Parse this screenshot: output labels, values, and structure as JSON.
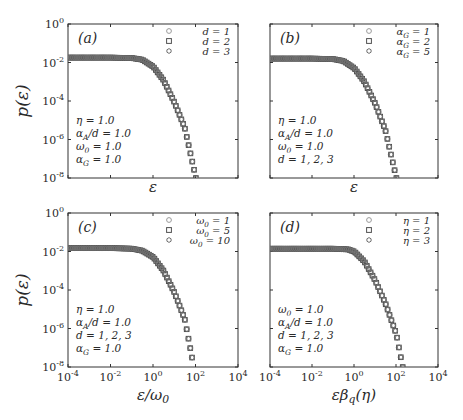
{
  "figure": {
    "width": 463,
    "height": 420,
    "y_label": "p(ε)",
    "y_ticks": [
      "10^0",
      "10^-2",
      "10^-4",
      "10^-6",
      "10^-8"
    ],
    "x_ticks": [
      "10^-4",
      "10^-2",
      "10^0",
      "10^2",
      "10^4"
    ],
    "colors": {
      "axis": "#333333",
      "marker_1": "#9a9a9a",
      "marker_2": "#505050",
      "marker_3": "#707070",
      "text": "#2a2a2a"
    }
  },
  "chart_data": [
    {
      "panel": "(a)",
      "type": "scatter",
      "title": "",
      "xlabel": "ε",
      "ylabel": "p(ε)",
      "xscale": "log",
      "yscale": "log",
      "xlim": [
        0.0001,
        10000
      ],
      "ylim": [
        1e-08,
        1
      ],
      "x_tick_labels_shown": false,
      "legend_position": "upper right",
      "legend": [
        {
          "marker": "circle",
          "label": "d = 1"
        },
        {
          "marker": "square",
          "label": "d = 2"
        },
        {
          "marker": "hexagon",
          "label": "d = 3"
        }
      ],
      "annotation": [
        "η = 1.0",
        "α_A/d = 1.0",
        "ω_0 = 1.0",
        "α_G = 1.0"
      ],
      "series": [
        {
          "name": "d = 1",
          "x": [
            0.0001,
            0.001,
            0.01,
            0.1,
            0.3,
            1,
            3,
            10,
            30,
            100
          ],
          "y": [
            0.018,
            0.018,
            0.018,
            0.017,
            0.014,
            0.006,
            0.0012,
            8e-05,
            4e-06,
            1e-08
          ]
        },
        {
          "name": "d = 2",
          "x": [
            0.0001,
            0.001,
            0.01,
            0.1,
            0.3,
            1,
            3,
            10,
            30,
            100
          ],
          "y": [
            0.018,
            0.018,
            0.018,
            0.017,
            0.014,
            0.006,
            0.0012,
            8e-05,
            4e-06,
            1e-08
          ]
        },
        {
          "name": "d = 3",
          "x": [
            0.0001,
            0.001,
            0.01,
            0.1,
            0.3,
            1,
            3,
            10,
            30,
            100
          ],
          "y": [
            0.018,
            0.018,
            0.018,
            0.017,
            0.014,
            0.006,
            0.0012,
            8e-05,
            4e-06,
            1e-08
          ]
        }
      ]
    },
    {
      "panel": "(b)",
      "type": "scatter",
      "title": "",
      "xlabel": "ε",
      "ylabel": "",
      "xscale": "log",
      "yscale": "log",
      "xlim": [
        0.0001,
        10000
      ],
      "ylim": [
        1e-08,
        1
      ],
      "x_tick_labels_shown": false,
      "legend_position": "upper right",
      "legend": [
        {
          "marker": "circle",
          "label": "α_G = 1"
        },
        {
          "marker": "square",
          "label": "α_G = 2"
        },
        {
          "marker": "hexagon",
          "label": "α_G = 5"
        }
      ],
      "annotation": [
        "η = 1.0",
        "α_A/d = 1.0",
        "ω_0 = 1.0",
        "d = 1, 2, 3"
      ],
      "series": [
        {
          "name": "α_G = 1",
          "x": [
            0.0001,
            0.001,
            0.01,
            0.1,
            0.3,
            1,
            3,
            10,
            30,
            100
          ],
          "y": [
            0.016,
            0.016,
            0.016,
            0.015,
            0.012,
            0.005,
            0.001,
            7e-05,
            3e-06,
            1e-08
          ]
        },
        {
          "name": "α_G = 2",
          "x": [
            0.0001,
            0.001,
            0.01,
            0.1,
            0.3,
            1,
            3,
            10,
            30,
            100
          ],
          "y": [
            0.016,
            0.016,
            0.016,
            0.015,
            0.012,
            0.005,
            0.001,
            7e-05,
            3e-06,
            1e-08
          ]
        },
        {
          "name": "α_G = 5",
          "x": [
            0.0001,
            0.001,
            0.01,
            0.1,
            0.3,
            1,
            3,
            10,
            30,
            100
          ],
          "y": [
            0.016,
            0.016,
            0.016,
            0.015,
            0.012,
            0.005,
            0.001,
            7e-05,
            3e-06,
            1e-08
          ]
        }
      ]
    },
    {
      "panel": "(c)",
      "type": "scatter",
      "title": "",
      "xlabel": "ε/ω_0",
      "ylabel": "p(ε)",
      "xscale": "log",
      "yscale": "log",
      "xlim": [
        0.0001,
        10000
      ],
      "ylim": [
        1e-08,
        1
      ],
      "x_tick_labels_shown": true,
      "legend_position": "upper right",
      "legend": [
        {
          "marker": "circle",
          "label": "ω_0 = 1"
        },
        {
          "marker": "square",
          "label": "ω_0 = 5"
        },
        {
          "marker": "hexagon",
          "label": "ω_0 = 10"
        }
      ],
      "annotation": [
        "η = 1.0",
        "α_A/d = 1.0",
        "d = 1, 2, 3",
        "α_G = 1.0"
      ],
      "series": [
        {
          "name": "ω_0 = 1",
          "x": [
            0.0001,
            0.001,
            0.01,
            0.1,
            0.3,
            1,
            3,
            10,
            30,
            80
          ],
          "y": [
            0.015,
            0.015,
            0.015,
            0.014,
            0.011,
            0.005,
            0.001,
            7e-05,
            3e-06,
            1e-08
          ]
        },
        {
          "name": "ω_0 = 5",
          "x": [
            0.0001,
            0.001,
            0.01,
            0.1,
            0.3,
            1,
            3,
            10,
            30,
            80
          ],
          "y": [
            0.015,
            0.015,
            0.015,
            0.014,
            0.011,
            0.005,
            0.001,
            7e-05,
            3e-06,
            1e-08
          ]
        },
        {
          "name": "ω_0 = 10",
          "x": [
            0.0001,
            0.001,
            0.01,
            0.1,
            0.3,
            1,
            3,
            10,
            30,
            80
          ],
          "y": [
            0.015,
            0.015,
            0.015,
            0.014,
            0.011,
            0.005,
            0.001,
            7e-05,
            3e-06,
            1e-08
          ]
        }
      ]
    },
    {
      "panel": "(d)",
      "type": "scatter",
      "title": "",
      "xlabel": "εβ_q(η)",
      "ylabel": "",
      "xscale": "log",
      "yscale": "log",
      "xlim": [
        0.0001,
        10000
      ],
      "ylim": [
        1e-08,
        1
      ],
      "x_tick_labels_shown": true,
      "legend_position": "upper right",
      "legend": [
        {
          "marker": "circle",
          "label": "η = 1"
        },
        {
          "marker": "square",
          "label": "η = 2"
        },
        {
          "marker": "hexagon",
          "label": "η = 3"
        }
      ],
      "annotation": [
        "ω_0 = 1.0",
        "α_A/d = 1.0",
        "d = 1, 2, 3",
        "α_G = 1.0"
      ],
      "series": [
        {
          "name": "η = 1",
          "x": [
            0.0001,
            0.001,
            0.01,
            0.1,
            0.5,
            1,
            3,
            10,
            30,
            100,
            200
          ],
          "y": [
            0.014,
            0.014,
            0.014,
            0.014,
            0.012,
            0.009,
            0.003,
            0.0003,
            2e-05,
            5e-07,
            1e-08
          ]
        },
        {
          "name": "η = 2",
          "x": [
            0.0001,
            0.001,
            0.01,
            0.1,
            0.5,
            1,
            3,
            10,
            30,
            100,
            200
          ],
          "y": [
            0.014,
            0.014,
            0.014,
            0.014,
            0.013,
            0.01,
            0.003,
            0.0003,
            2e-05,
            5e-07,
            1e-08
          ]
        },
        {
          "name": "η = 3",
          "x": [
            0.0001,
            0.001,
            0.01,
            0.1,
            0.5,
            1,
            3,
            10,
            30,
            100,
            200
          ],
          "y": [
            0.014,
            0.014,
            0.014,
            0.014,
            0.013,
            0.01,
            0.003,
            0.0003,
            2e-05,
            5e-07,
            1e-08
          ]
        }
      ]
    }
  ],
  "layout": {
    "panels": [
      {
        "left": 68,
        "top": 24,
        "width": 170,
        "height": 154,
        "ylabel_x": 22,
        "xlabel_y": 192
      },
      {
        "left": 270,
        "top": 24,
        "width": 168,
        "height": 154,
        "ylabel_x": null,
        "xlabel_y": 192
      },
      {
        "left": 68,
        "top": 213,
        "width": 170,
        "height": 154,
        "ylabel_x": 22,
        "xlabel_y": 400
      },
      {
        "left": 270,
        "top": 213,
        "width": 168,
        "height": 154,
        "ylabel_x": null,
        "xlabel_y": 400
      }
    ]
  }
}
